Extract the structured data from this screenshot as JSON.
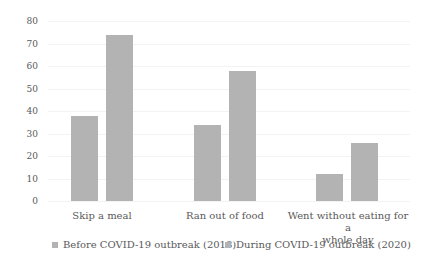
{
  "chart_data": {
    "type": "bar",
    "title": "",
    "xlabel": "",
    "ylabel": "",
    "ylim": [
      0,
      80
    ],
    "yticks": [
      0,
      10,
      20,
      30,
      40,
      50,
      60,
      70,
      80
    ],
    "grid": true,
    "legend_position": "bottom",
    "categories": [
      "Skip a meal",
      "Ran out of food",
      "Went without eating for a whole day"
    ],
    "series": [
      {
        "name": "Before COVID-19 outbreak (2018)",
        "color": "#b3b3b3",
        "values": [
          38,
          34,
          12
        ]
      },
      {
        "name": "During COVID-19 outbreak (2020)",
        "color": "#b3b3b3",
        "values": [
          74,
          58,
          26
        ]
      }
    ]
  },
  "labels": {
    "categories": [
      "Skip a meal",
      "Ran out of food",
      "Went without eating for a",
      "whole day"
    ],
    "legend": [
      "Before COVID-19 outbreak (2018)",
      "During COVID-19 outbreak (2020)"
    ],
    "yticks": [
      "80",
      "70",
      "60",
      "50",
      "40",
      "30",
      "20",
      "10",
      "0"
    ]
  }
}
